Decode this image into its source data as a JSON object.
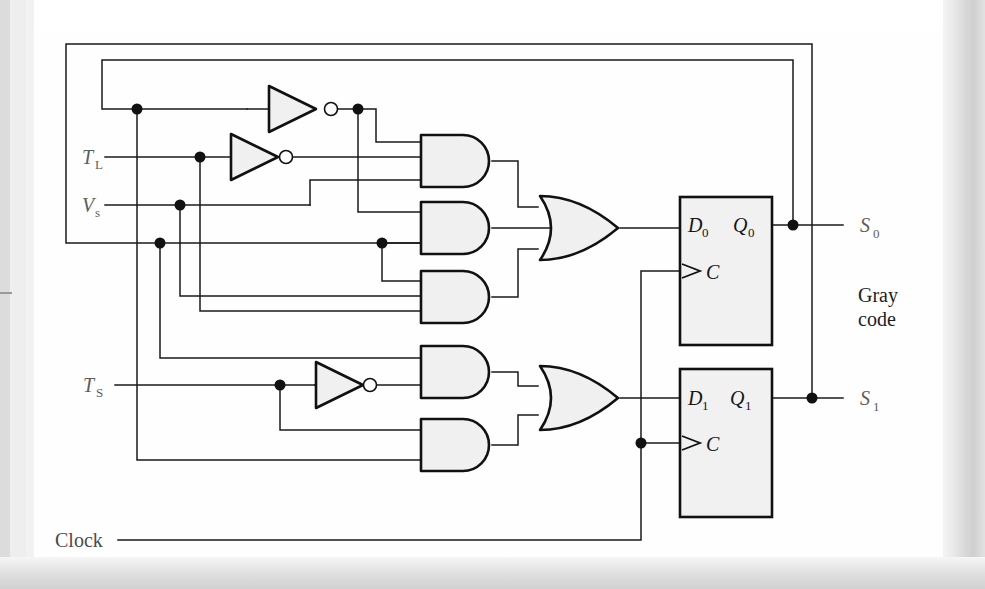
{
  "figure": {
    "domain": "Diagram",
    "kind": "digital-logic-circuit"
  },
  "inputs": [
    {
      "id": "TL",
      "base": "T",
      "sub": "L",
      "name": "T-sub-L input"
    },
    {
      "id": "VS",
      "base": "V",
      "sub": "s",
      "name": "V-sub-s input"
    },
    {
      "id": "TS",
      "base": "T",
      "sub": "S",
      "name": "T-sub-S input"
    },
    {
      "id": "CLK",
      "base": "Clock",
      "sub": "",
      "name": "clock input"
    }
  ],
  "outputs": [
    {
      "id": "S0",
      "base": "S",
      "sub": "0",
      "name": "S-sub-0 output"
    },
    {
      "id": "S1",
      "base": "S",
      "sub": "1",
      "name": "S-sub-1 output"
    }
  ],
  "annotations": {
    "gray_code_line1": "Gray",
    "gray_code_line2": "code"
  },
  "flipflops": [
    {
      "id": "FF0",
      "d_base": "D",
      "d_sub": "0",
      "q_base": "Q",
      "q_sub": "0",
      "clk_label": "C"
    },
    {
      "id": "FF1",
      "d_base": "D",
      "d_sub": "1",
      "q_base": "Q",
      "q_sub": "1",
      "clk_label": "C"
    }
  ],
  "gates": {
    "inverters": [
      {
        "id": "INV1",
        "name": "inverter-top",
        "inputs": 1
      },
      {
        "id": "INV2",
        "name": "inverter-middle",
        "inputs": 1
      },
      {
        "id": "INV3",
        "name": "inverter-bottom",
        "inputs": 1
      }
    ],
    "and_gates": [
      {
        "id": "AND1",
        "name": "and-gate-1",
        "inputs": 3
      },
      {
        "id": "AND2",
        "name": "and-gate-2",
        "inputs": 2
      },
      {
        "id": "AND3",
        "name": "and-gate-3",
        "inputs": 3
      },
      {
        "id": "AND4",
        "name": "and-gate-4",
        "inputs": 2
      },
      {
        "id": "AND5",
        "name": "and-gate-5",
        "inputs": 2
      }
    ],
    "or_gates": [
      {
        "id": "OR1",
        "name": "or-gate-top",
        "inputs": 3
      },
      {
        "id": "OR2",
        "name": "or-gate-bottom",
        "inputs": 2
      }
    ]
  },
  "colors": {
    "wire": "#1a1a1a",
    "gate_fill": "#f0f0f0",
    "gate_stroke": "#111111",
    "label_grey": "#5d5d5d",
    "paper": "#fefefe",
    "scan_margin": "#dcdcdc"
  },
  "counts": {
    "inverters": 3,
    "and_gates": 5,
    "or_gates": 2,
    "flip_flops": 2,
    "junction_dots": 12
  }
}
